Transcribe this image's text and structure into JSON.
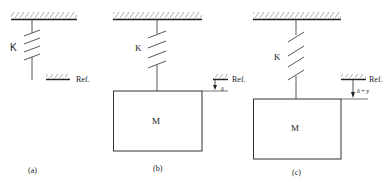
{
  "figure": {
    "panels": [
      {
        "id": "a",
        "caption": "(a)",
        "spring_label": "K",
        "reference_label": "Ref.",
        "has_mass": false
      },
      {
        "id": "b",
        "caption": "(b)",
        "spring_label": "K",
        "mass_label": "M",
        "reference_label": "Ref.",
        "displacement_label": "δ",
        "has_mass": true
      },
      {
        "id": "c",
        "caption": "(c)",
        "spring_label": "K",
        "mass_label": "M",
        "reference_label": "Ref.",
        "displacement_label": "δ + y",
        "has_mass": true
      }
    ],
    "colors": {
      "line": "#222222",
      "hatch": "#888888",
      "background": "#ffffff"
    }
  }
}
